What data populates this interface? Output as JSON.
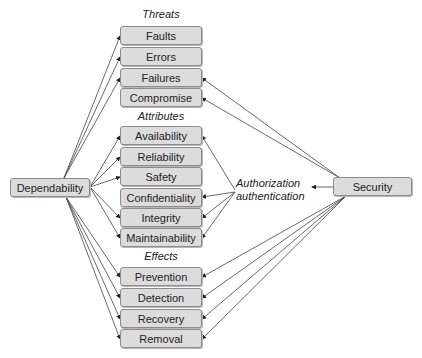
{
  "diagram": {
    "left_node": "Dependability",
    "right_node": "Security",
    "middle_label_line1": "Authorization",
    "middle_label_line2": "authentication",
    "groups": [
      {
        "title": "Threats",
        "items": [
          "Faults",
          "Errors",
          "Failures",
          "Compromise"
        ]
      },
      {
        "title": "Attributes",
        "items": [
          "Availability",
          "Reliability",
          "Safety",
          "Confidentiality",
          "Integrity",
          "Maintainability"
        ]
      },
      {
        "title": "Effects",
        "items": [
          "Prevention",
          "Detection",
          "Recovery",
          "Removal"
        ]
      }
    ],
    "edges": {
      "dependability_to": [
        "Faults",
        "Errors",
        "Failures",
        "Availability",
        "Reliability",
        "Safety",
        "Integrity",
        "Maintainability",
        "Prevention",
        "Detection",
        "Recovery",
        "Removal"
      ],
      "security_to": [
        "Failures",
        "Compromise",
        "Prevention",
        "Detection",
        "Recovery",
        "Removal",
        "Authorization authentication"
      ],
      "authorization_authentication_to": [
        "Availability",
        "Confidentiality",
        "Integrity",
        "Maintainability"
      ]
    },
    "colors": {
      "box_fill": "#dcdcdc",
      "box_border": "#8c8c8c",
      "line": "#333333"
    }
  }
}
